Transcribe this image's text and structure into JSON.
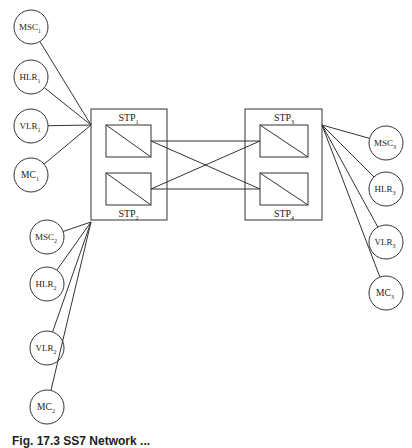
{
  "diagram": {
    "type": "network-topology",
    "stroke_color": "#333333",
    "stp_clusters": [
      {
        "id": "left",
        "box": {
          "x": 91,
          "y": 109,
          "w": 76,
          "h": 111
        },
        "nodes": [
          {
            "id": "STP1",
            "base": "STP",
            "sub": "1",
            "rect": {
              "x": 106,
              "y": 125,
              "w": 45,
              "h": 32
            },
            "label_pos": "above"
          },
          {
            "id": "STP2",
            "base": "STP",
            "sub": "2",
            "rect": {
              "x": 106,
              "y": 173,
              "w": 45,
              "h": 32
            },
            "label_pos": "below"
          }
        ]
      },
      {
        "id": "right",
        "box": {
          "x": 245,
          "y": 109,
          "w": 77,
          "h": 111
        },
        "nodes": [
          {
            "id": "STP3",
            "base": "STP",
            "sub": "3",
            "rect": {
              "x": 260,
              "y": 125,
              "w": 48,
              "h": 32
            },
            "label_pos": "above"
          },
          {
            "id": "STP4",
            "base": "STP",
            "sub": "4",
            "rect": {
              "x": 260,
              "y": 173,
              "w": 48,
              "h": 32
            },
            "label_pos": "below"
          }
        ]
      }
    ],
    "stp_links": [
      {
        "from": "STP1",
        "to": "STP3"
      },
      {
        "from": "STP1",
        "to": "STP4"
      },
      {
        "from": "STP2",
        "to": "STP3"
      },
      {
        "from": "STP2",
        "to": "STP4"
      }
    ],
    "entity_groups": [
      {
        "id": "group-1",
        "hub": {
          "x": 91,
          "y": 125
        },
        "entities": [
          {
            "base": "MSC",
            "sub": "1",
            "cx": 31,
            "cy": 27
          },
          {
            "base": "HLR",
            "sub": "1",
            "cx": 31,
            "cy": 77
          },
          {
            "base": "VLR",
            "sub": "1",
            "cx": 31,
            "cy": 126
          },
          {
            "base": "MC",
            "sub": "1",
            "cx": 31,
            "cy": 175
          }
        ]
      },
      {
        "id": "group-2",
        "hub": {
          "x": 91,
          "y": 222
        },
        "entities": [
          {
            "base": "MSC",
            "sub": "2",
            "cx": 47,
            "cy": 237
          },
          {
            "base": "HLR",
            "sub": "2",
            "cx": 47,
            "cy": 284
          },
          {
            "base": "VLR",
            "sub": "2",
            "cx": 47,
            "cy": 348
          },
          {
            "base": "MC",
            "sub": "2",
            "cx": 47,
            "cy": 407
          }
        ]
      },
      {
        "id": "group-3",
        "hub": {
          "x": 322,
          "y": 125
        },
        "entities": [
          {
            "base": "MSC",
            "sub": "3",
            "cx": 386,
            "cy": 143
          },
          {
            "base": "HLR",
            "sub": "3",
            "cx": 386,
            "cy": 189
          },
          {
            "base": "VLR",
            "sub": "3",
            "cx": 386,
            "cy": 242
          },
          {
            "base": "MC",
            "sub": "3",
            "cx": 386,
            "cy": 293
          }
        ]
      }
    ],
    "circle_radius": 17
  },
  "caption": {
    "text": "Fig. 17.3  SS7 Network ..."
  }
}
